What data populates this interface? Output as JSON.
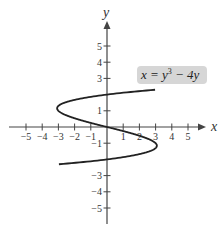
{
  "chart_data": {
    "type": "line",
    "title": "",
    "equation": "x = y^3 - 4y",
    "xlabel": "x",
    "ylabel": "y",
    "xlim": [
      -6,
      6
    ],
    "ylim": [
      -6,
      6
    ],
    "x_ticks": [
      -5,
      -4,
      -3,
      -2,
      -1,
      1,
      2,
      3,
      4,
      5
    ],
    "y_ticks": [
      -5,
      -4,
      -3,
      -1,
      1,
      3,
      4,
      5
    ],
    "y_tick_labels_shown": [
      "5",
      "4",
      "3",
      "1",
      "-1",
      "-3",
      "-4",
      "-5"
    ],
    "x_tick_labels_shown": [
      "-5",
      "-4",
      "-3",
      "-2",
      "-1",
      "1",
      "2",
      "3",
      "4",
      "5"
    ],
    "grid": false,
    "legend": null,
    "series": [
      {
        "name": "x = y^3 - 4y",
        "parametric_in": "y",
        "y_range": [
          -2.3,
          2.3
        ],
        "points": [
          {
            "y": -2.3,
            "x": -2.97
          },
          {
            "y": -2.0,
            "x": 0
          },
          {
            "y": -1.15,
            "x": 3.08
          },
          {
            "y": 0,
            "x": 0
          },
          {
            "y": 1.15,
            "x": -3.08
          },
          {
            "y": 2.0,
            "x": 0
          },
          {
            "y": 2.3,
            "x": 2.97
          }
        ]
      }
    ],
    "annotations": [
      {
        "text": "x = y³ − 4y",
        "position": "upper right, gray rounded box"
      }
    ]
  },
  "labels": {
    "x_axis": "x",
    "y_axis": "y",
    "equation_lhs": "x = y",
    "equation_exp": "3",
    "equation_rhs": " − 4y"
  },
  "colors": {
    "curve": "#222222",
    "axes": "#444444",
    "label_bg": "#d6d6d6"
  }
}
